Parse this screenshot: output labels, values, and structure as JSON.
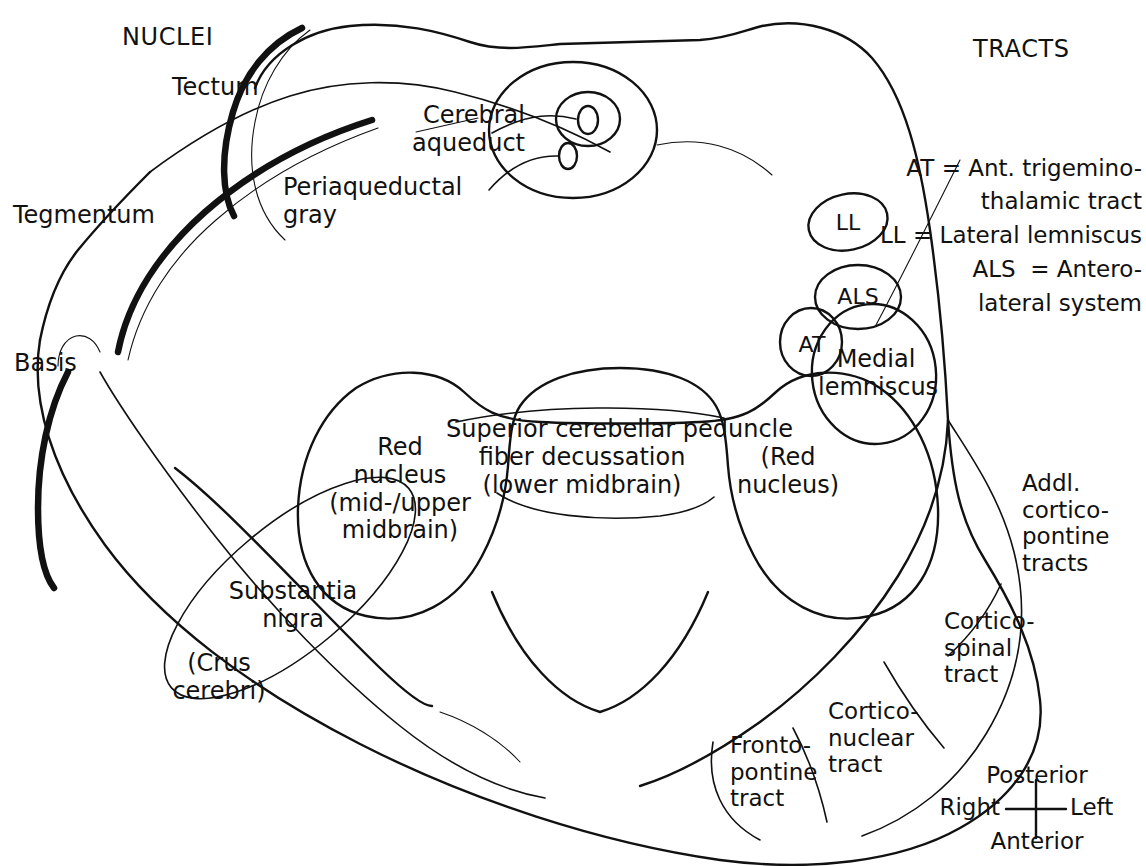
{
  "diagram": {
    "type": "midbrain-cross-section",
    "headings": {
      "left": "NUCLEI",
      "right": "TRACTS"
    },
    "region_labels": {
      "tectum": "Tectum",
      "tegmentum": "Tegmentum",
      "basis": "Basis"
    },
    "nuclei_labels": {
      "cerebral_aqueduct": "Cerebral\naqueduct",
      "periaqueductal_gray": "Periaqueductal\ngray",
      "red_nucleus_left": "Red\nnucleus\n(mid-/upper\nmidbrain)",
      "red_nucleus_right": "(Red\nnucleus)",
      "scp_decussation": "Superior cerebellar peduncle\nfiber decussation\n(lower midbrain)",
      "substantia_nigra": "Substantia\nnigra",
      "crus_cerebri": "(Crus\ncerebri)"
    },
    "tract_ovals": [
      {
        "id": "ll",
        "label": "LL"
      },
      {
        "id": "als",
        "label": "ALS"
      },
      {
        "id": "at",
        "label": "AT"
      },
      {
        "id": "medial-lemniscus",
        "label": "Medial\nlemniscus"
      }
    ],
    "legend": [
      "AT = Ant. trigemino-",
      "thalamic tract",
      "LL = Lateral lemniscus",
      "ALS  = Antero-",
      "lateral system"
    ],
    "basis_tract_labels": {
      "addl_corticopontine": "Addl.\ncortico-\npontine\ntracts",
      "corticospinal": "Cortico-\nspinal\ntract",
      "corticonuclear": "Cortico-\nnuclear\ntract",
      "frontopontine": "Fronto-\npontine\ntract"
    },
    "orientation_compass": {
      "top": "Posterior",
      "bottom": "Anterior",
      "left": "Right",
      "right": "Left"
    },
    "colors": {
      "ink": "#111111",
      "background": "#ffffff"
    }
  }
}
